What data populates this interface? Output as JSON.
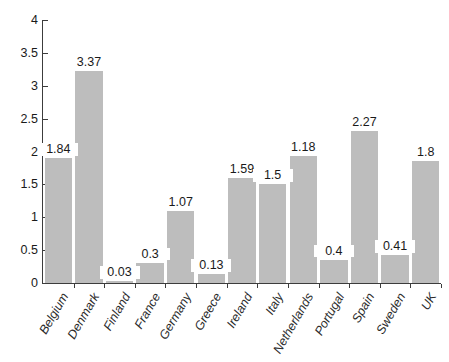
{
  "chart_data": {
    "type": "bar",
    "title": "",
    "subtitle": "",
    "xlabel": "",
    "ylabel": "",
    "categories": [
      "Belgium",
      "Denmark",
      "Finland",
      "France",
      "Germany",
      "Greece",
      "Ireland",
      "Italy",
      "Netherlands",
      "Portugal",
      "Spain",
      "Sweden",
      "UK"
    ],
    "values": [
      1.84,
      3.37,
      0.03,
      0.3,
      1.07,
      0.13,
      1.59,
      1.5,
      1.18,
      0.4,
      2.27,
      0.41,
      1.8
    ],
    "bar_heights": [
      1.9,
      3.22,
      0.03,
      0.31,
      1.09,
      0.13,
      1.59,
      1.5,
      1.93,
      0.35,
      2.31,
      0.42,
      1.86
    ],
    "data_labels": [
      "1.84",
      "3.37",
      "0.03",
      "0.3",
      "1.07",
      "0.13",
      "1.59",
      "1.5",
      "1.18",
      "0.4",
      "2.27",
      "0.41",
      "1.8"
    ],
    "ylim": [
      0,
      4
    ],
    "ytick_values": [
      0,
      0.5,
      1,
      1.5,
      2,
      2.5,
      3,
      3.5,
      4
    ],
    "ytick_labels": [
      "0",
      "0.5",
      "1",
      "1.5",
      "2",
      "2.5",
      "3",
      "3.5",
      "4"
    ],
    "grid": false,
    "legend": null,
    "legend_position": "none",
    "bar_color": "#bdbdbd",
    "axis_color": "#3c3c3c",
    "text_color": "#1a1a1a",
    "background_color": "#ffffff",
    "category_label_rotation_deg": -60
  }
}
